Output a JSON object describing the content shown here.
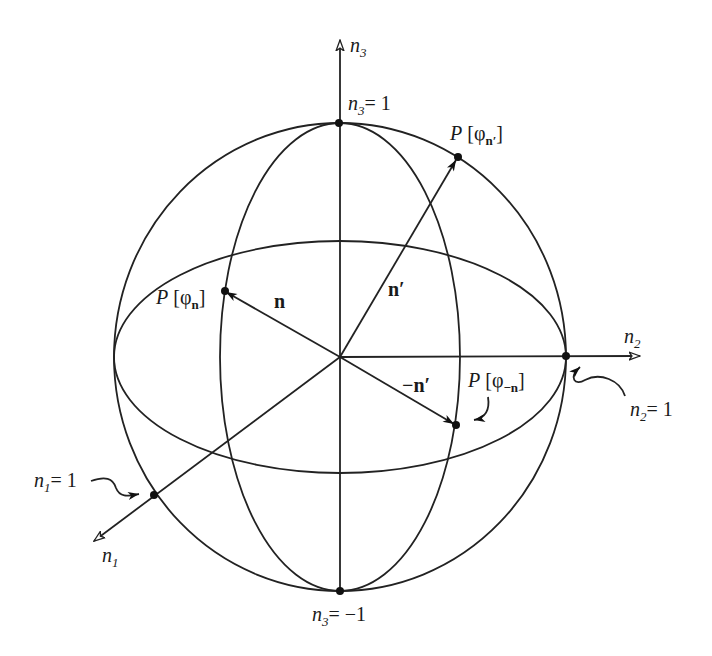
{
  "diagram": {
    "axes": {
      "n1": {
        "name": "n",
        "index": "1",
        "unit_label_name": "n",
        "unit_label_index": "1",
        "unit_label_value": "= 1"
      },
      "n2": {
        "name": "n",
        "index": "2",
        "unit_label_name": "n",
        "unit_label_index": "2",
        "unit_label_value": "= 1"
      },
      "n3": {
        "name": "n",
        "index": "3",
        "top_label_name": "n",
        "top_label_index": "3",
        "top_label_value": "= 1",
        "bottom_label_name": "n",
        "bottom_label_index": "3",
        "bottom_label_value": "= −1"
      }
    },
    "vectors": [
      {
        "id": "n",
        "label": "n"
      },
      {
        "id": "n-prime",
        "label": "n′"
      },
      {
        "id": "minus-n-prime",
        "label": "−n′"
      }
    ],
    "points": [
      {
        "id": "P-phi-n",
        "P": "P",
        "open": " [φ",
        "sub": "n",
        "close": "]"
      },
      {
        "id": "P-phi-n-prime",
        "P": "P",
        "open": " [φ",
        "sub": "n′",
        "close": "]"
      },
      {
        "id": "P-phi-minus-n",
        "P": "P",
        "open": " [φ",
        "sub": "−n",
        "close": "]"
      }
    ]
  }
}
